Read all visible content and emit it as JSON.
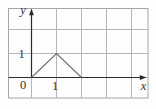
{
  "figure": {
    "labels": {
      "y_axis": "y",
      "x_axis": "x",
      "origin": "0",
      "x_tick_1": "1",
      "y_tick_1": "1"
    },
    "colors": {
      "background": "#fdfdfd",
      "frame": "#a6a6a6",
      "grid": "#b6b6b6",
      "axis": "#2b2b2b",
      "curve": "#6f6f6f",
      "text": "#333333"
    }
  },
  "chart_data": {
    "type": "line",
    "title": "",
    "xlabel": "x",
    "ylabel": "y",
    "points": [
      [
        0,
        0
      ],
      [
        1,
        1
      ],
      [
        2,
        0
      ]
    ],
    "x_ticks": [
      {
        "value": 1,
        "label": "1"
      }
    ],
    "y_ticks": [
      {
        "value": 1,
        "label": "1"
      }
    ],
    "origin_label": "0",
    "xlim": [
      -0.9,
      4.7
    ],
    "ylim": [
      -0.9,
      2.9
    ],
    "grid": true,
    "legend": false
  }
}
